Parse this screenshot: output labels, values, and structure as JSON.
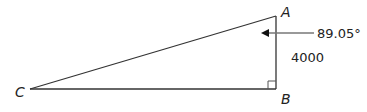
{
  "diagram": {
    "type": "right-triangle",
    "vertices": {
      "A": {
        "label": "A"
      },
      "B": {
        "label": "B"
      },
      "C": {
        "label": "C"
      }
    },
    "angle_annotation": {
      "vertex": "A",
      "value": "89.05°"
    },
    "side_annotation": {
      "side": "AB",
      "value": "4000"
    },
    "right_angle_at": "B"
  },
  "colors": {
    "triangle_line": "#333333",
    "arrow_line": "#777777",
    "arrow_head": "#111111",
    "text": "#222222"
  }
}
